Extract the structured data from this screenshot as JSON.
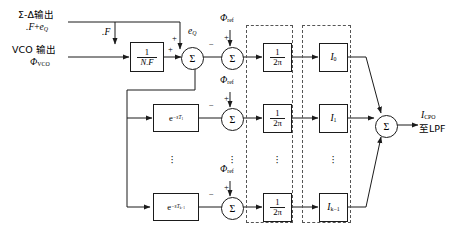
{
  "figure": {
    "stroke_color": "#1b1b1b",
    "dashed_color": "#555555",
    "background": "#ffffff"
  },
  "inputs": {
    "sigma_delta": {
      "line1": "Σ-Δ输出",
      "line2_main": ".F",
      "line2_plus": "+",
      "line2_err": "e",
      "line2_err_sub": "Q"
    },
    "vco": {
      "line1": "VCO 输出",
      "line2_symbol": "Φ",
      "line2_sub": "VCO"
    }
  },
  "blocks": {
    "divider": {
      "numerator": "1",
      "denominator": "N.F",
      "tap_label": ".F"
    },
    "delays": [
      {
        "base": "e",
        "exp_prefix": "−s",
        "exp_symbol": "T",
        "exp_sub": "1"
      },
      {
        "base": "e",
        "exp_prefix": "−s",
        "exp_symbol": "T",
        "exp_sub": "k−1"
      }
    ],
    "scale_blocks": [
      {
        "numerator": "1",
        "denominator": "2π"
      },
      {
        "numerator": "1",
        "denominator": "2π"
      },
      {
        "numerator": "1",
        "denominator": "2π"
      }
    ],
    "current_blocks": [
      {
        "symbol": "I",
        "sub": "0"
      },
      {
        "symbol": "I",
        "sub": "1"
      },
      {
        "symbol": "I",
        "sub": "k−1"
      }
    ]
  },
  "summers": {
    "input_summer": {
      "glyph": "Σ",
      "sign_top": "+",
      "sign_left": "+",
      "quant_label_symbol": "e",
      "quant_label_sub": "Q"
    },
    "phase_summers": [
      {
        "glyph": "Σ",
        "sign_top": "+",
        "sign_left": "−",
        "ref_symbol": "Φ",
        "ref_sub": "ref"
      },
      {
        "glyph": "Σ",
        "sign_top": "+",
        "sign_left": "−",
        "ref_symbol": "Φ",
        "ref_sub": "ref"
      },
      {
        "glyph": "Σ",
        "sign_top": "+",
        "sign_left": "−",
        "ref_symbol": "Φ",
        "ref_sub": "ref"
      }
    ],
    "output_summer": {
      "glyph": "Σ"
    }
  },
  "output": {
    "symbol": "I",
    "sub": "CPO",
    "destination": "至LPF"
  },
  "ellipses": {
    "delay_column": "⋮",
    "scale_column": "⋮",
    "current_column": "⋮",
    "summer_column": "⋮"
  }
}
